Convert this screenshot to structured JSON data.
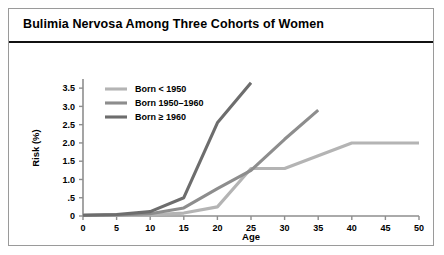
{
  "figure": {
    "title": "Bulimia Nervosa  Among Three Cohorts of Women",
    "border_color": "#9a9a9a",
    "title_rule_color": "#111111",
    "background": "#ffffff"
  },
  "chart_data": {
    "type": "line",
    "title": "Bulimia Nervosa  Among Three Cohorts of Women",
    "xlabel": "Age",
    "ylabel": "Risk (%)",
    "xlim": [
      0,
      50
    ],
    "ylim": [
      0,
      3.75
    ],
    "grid": false,
    "legend_position": "top-left",
    "xticks": [
      0,
      5,
      10,
      15,
      20,
      25,
      30,
      35,
      40,
      45,
      50
    ],
    "xticklabels": [
      "0",
      "5",
      "10",
      "15",
      "20",
      "25",
      "30",
      "35",
      "40",
      "45",
      "50"
    ],
    "yticks": [
      0,
      0.5,
      1.0,
      1.5,
      2.0,
      2.5,
      3.0,
      3.5
    ],
    "yticklabels": [
      "0",
      ".5",
      "1.0",
      "1.5",
      "2.0",
      "2.5",
      "3.0",
      "3.5"
    ],
    "series": [
      {
        "name": "Born < 1950",
        "color": "#b4b4b4",
        "x": [
          0,
          5,
          10,
          15,
          20,
          25,
          30,
          35,
          40,
          45,
          50
        ],
        "y": [
          0.02,
          0.02,
          0.03,
          0.08,
          0.25,
          1.3,
          1.3,
          1.65,
          2.0,
          2.0,
          2.0
        ]
      },
      {
        "name": "Born 1950–1960",
        "color": "#8d8d8d",
        "x": [
          0,
          5,
          10,
          15,
          20,
          25,
          30,
          35
        ],
        "y": [
          0.02,
          0.03,
          0.06,
          0.22,
          0.75,
          1.25,
          2.1,
          2.9
        ]
      },
      {
        "name": "Born ≥ 1960",
        "color": "#6d6d6d",
        "x": [
          0,
          5,
          10,
          15,
          20,
          25
        ],
        "y": [
          0.02,
          0.04,
          0.12,
          0.5,
          2.55,
          3.65
        ]
      }
    ]
  }
}
